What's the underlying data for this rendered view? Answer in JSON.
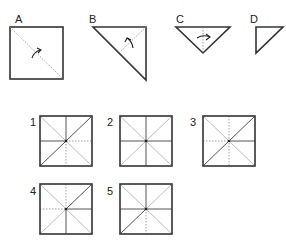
{
  "steps": [
    {
      "label": "A",
      "shape": "square",
      "fold": "diagonal top-left to bottom-right, fold lower-left up",
      "arrow": "curved up-right"
    },
    {
      "label": "B",
      "shape": "right triangle",
      "fold": "from hypotenuse midpoint to right-angle corner",
      "arrow": "curved up-left"
    },
    {
      "label": "C",
      "shape": "inverted triangle",
      "fold": "vertical center line",
      "arrow": "right"
    },
    {
      "label": "D",
      "shape": "small right triangle",
      "fold": "final state",
      "arrow": "none"
    }
  ],
  "options": [
    {
      "label": "1",
      "solid": [
        "vertical-top",
        "horizontal-left",
        "diag-bl-tr"
      ],
      "dotted": [
        "vertical-bottom",
        "horizontal-right"
      ],
      "faint": [
        "diag-tl-br"
      ]
    },
    {
      "label": "2",
      "solid": [
        "vertical-full",
        "horizontal-full"
      ],
      "dotted": [],
      "faint": [
        "diag-tl-br",
        "diag-bl-tr"
      ]
    },
    {
      "label": "3",
      "solid": [
        "horizontal-right",
        "diag-bl-tr"
      ],
      "dotted": [
        "vertical-full",
        "horizontal-left"
      ],
      "faint": [
        "diag-tl-br"
      ]
    },
    {
      "label": "4",
      "solid": [
        "horizontal-right",
        "vertical-bottom",
        "diag-center-tr"
      ],
      "dotted": [
        "vertical-top",
        "horizontal-left"
      ],
      "faint": [
        "diag-tl-br",
        "diag-bl-center"
      ]
    },
    {
      "label": "5",
      "solid": [
        "horizontal-full",
        "vertical-top",
        "diag-bl-center"
      ],
      "dotted": [
        "vertical-bottom"
      ],
      "faint": [
        "diag-tl-br",
        "diag-center-tr"
      ]
    }
  ]
}
